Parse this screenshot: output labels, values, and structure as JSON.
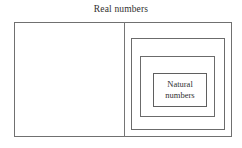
{
  "diagram": {
    "title": "Real numbers",
    "type": "nested-set-diagram",
    "boxes": [
      {
        "id": "real",
        "label": "Real numbers",
        "level": 1,
        "label_position": "above-top",
        "border_color": "#707070"
      },
      {
        "id": "level2",
        "label": "",
        "level": 2,
        "label_position": "none",
        "border_color": "#6b6b6b"
      },
      {
        "id": "level3",
        "label": "",
        "level": 3,
        "label_position": "none",
        "border_color": "#6b6b6b"
      },
      {
        "id": "natural",
        "label": "Natural numbers",
        "level": 4,
        "label_position": "inside-center",
        "border_color": "#5f5f5f"
      }
    ],
    "divider": {
      "orientation": "vertical",
      "color": "#757575"
    }
  },
  "labels": {
    "outer_title": "Real numbers",
    "natural_line1": "Natural",
    "natural_line2": "numbers"
  },
  "colors": {
    "background": "#ffffff",
    "line": "#6e6e6e",
    "text": "#2f2f2f"
  }
}
